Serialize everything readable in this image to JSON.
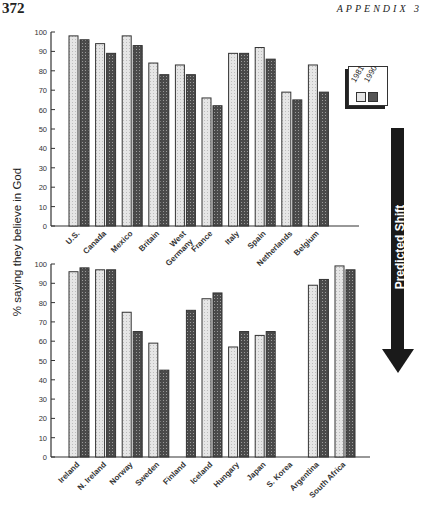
{
  "page": {
    "page_number": "372",
    "running_head": "APPENDIX 3"
  },
  "legend": {
    "items": [
      {
        "label": "1981",
        "pattern": "light"
      },
      {
        "label": "1990",
        "pattern": "dark"
      }
    ]
  },
  "arrow": {
    "label": "Predicted Shift",
    "direction": "down"
  },
  "colors": {
    "light_bar": "#e4e4e4",
    "dark_bar": "#555555",
    "axis": "#333333",
    "arrow": "#1a1a1a"
  },
  "chart_data": [
    {
      "type": "bar",
      "title": "",
      "xlabel": "",
      "ylabel": "% saying they believe in God",
      "ylim": [
        0,
        100
      ],
      "yticks": [
        0,
        10,
        20,
        30,
        40,
        50,
        60,
        70,
        80,
        90,
        100
      ],
      "grid": false,
      "legend_position": "upper right",
      "categories": [
        "U.S.",
        "Canada",
        "Mexico",
        "Britain",
        "West Germany",
        "France",
        "Italy",
        "Spain",
        "Netherlands",
        "Belgium"
      ],
      "series": [
        {
          "name": "1981",
          "values": [
            98,
            94,
            98,
            84,
            83,
            66,
            89,
            92,
            69,
            83
          ]
        },
        {
          "name": "1990",
          "values": [
            96,
            89,
            93,
            78,
            78,
            62,
            89,
            86,
            65,
            69
          ]
        }
      ]
    },
    {
      "type": "bar",
      "title": "",
      "xlabel": "",
      "ylabel": "% saying they believe in God",
      "ylim": [
        0,
        100
      ],
      "yticks": [
        0,
        10,
        20,
        30,
        40,
        50,
        60,
        70,
        80,
        90,
        100
      ],
      "grid": false,
      "categories": [
        "Ireland",
        "N. Ireland",
        "Norway",
        "Sweden",
        "Finland",
        "Iceland",
        "Hungary",
        "Japan",
        "S. Korea",
        "Argentina",
        "South Africa"
      ],
      "series": [
        {
          "name": "1981",
          "values": [
            96,
            97,
            75,
            59,
            null,
            82,
            57,
            63,
            null,
            89,
            99
          ]
        },
        {
          "name": "1990",
          "values": [
            98,
            97,
            65,
            45,
            76,
            85,
            65,
            65,
            null,
            92,
            97
          ]
        }
      ]
    }
  ]
}
